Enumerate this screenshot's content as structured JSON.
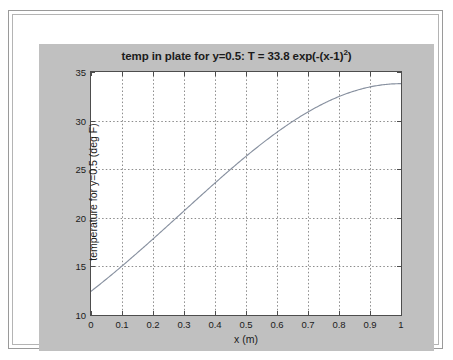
{
  "figure": {
    "background_color": "#c0c0c0",
    "axes_background_color": "#ffffff",
    "axes_border_color": "#4d4d4d",
    "grid_color": "#8c8c8c",
    "line_color": "#8891a0",
    "text_color": "#1b1b1b"
  },
  "chart_data": {
    "type": "line",
    "title": "temp in plate for y=0.5: T = 33.8 exp(-(x-1)",
    "title_superscript": "2",
    "title_suffix": ")",
    "title_full": "temp in plate for y=0.5: T = 33.8 exp(-(x-1)^2)",
    "xlabel": "x (m)",
    "ylabel": "temperature for y=0.5 (deg F)",
    "xlim": [
      0,
      1
    ],
    "ylim": [
      10,
      35
    ],
    "xticks": [
      0,
      0.1,
      0.2,
      0.3,
      0.4,
      0.5,
      0.6,
      0.7,
      0.8,
      0.9,
      1
    ],
    "xtick_labels": [
      "0",
      "0.1",
      "0.2",
      "0.3",
      "0.4",
      "0.5",
      "0.6",
      "0.7",
      "0.8",
      "0.9",
      "1"
    ],
    "yticks": [
      10,
      15,
      20,
      25,
      30,
      35
    ],
    "ytick_labels": [
      "10",
      "15",
      "20",
      "25",
      "30",
      "35"
    ],
    "grid": true,
    "grid_style": "dotted",
    "legend": null,
    "equation": "T = 33.8 * exp(-(x-1)^2)",
    "series": [
      {
        "name": "T(x)",
        "x": [
          0,
          0.05,
          0.1,
          0.15,
          0.2,
          0.25,
          0.3,
          0.35,
          0.4,
          0.45,
          0.5,
          0.55,
          0.6,
          0.65,
          0.7,
          0.75,
          0.8,
          0.85,
          0.9,
          0.95,
          1
        ],
        "values": [
          12.43,
          13.62,
          14.87,
          16.16,
          17.48,
          18.81,
          20.14,
          21.44,
          22.71,
          23.92,
          25.06,
          26.12,
          27.08,
          27.93,
          28.66,
          29.26,
          29.73,
          30.06,
          30.25,
          30.31,
          30.24
        ]
      }
    ],
    "y_values_at_ticks": {
      "0": 12.43,
      "0.1": 14.87,
      "0.2": 17.48,
      "0.3": 20.14,
      "0.4": 22.71,
      "0.5": 26.32,
      "0.6": 28.79,
      "0.7": 30.86,
      "0.8": 32.47,
      "0.9": 33.46,
      "1": 33.8
    }
  }
}
